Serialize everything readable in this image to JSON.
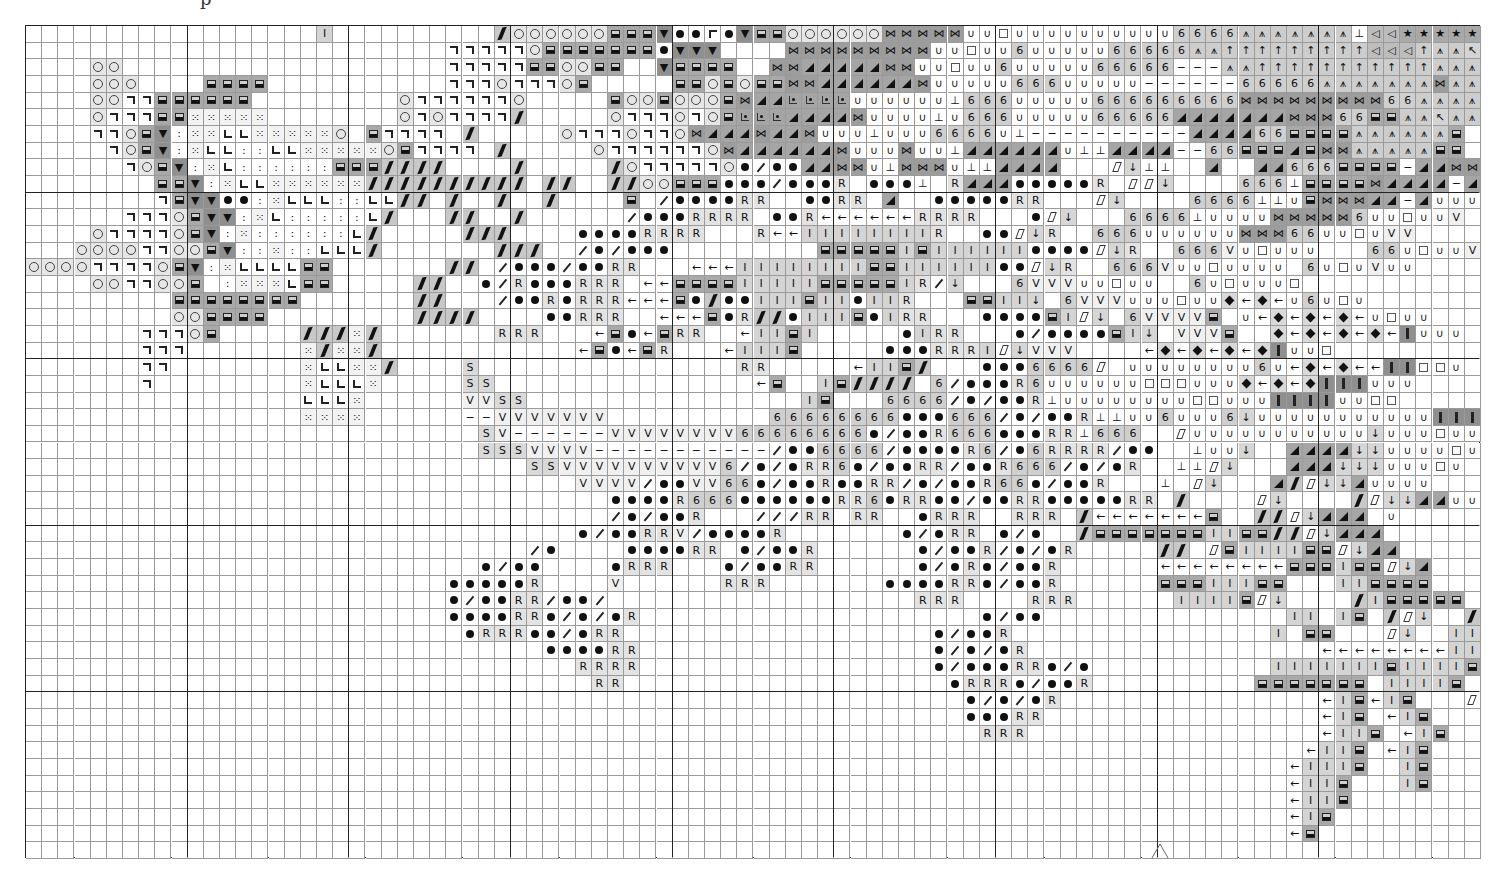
{
  "page": {
    "header_fragment": "p",
    "continuation_marker": "^"
  },
  "chart_data": {
    "type": "table",
    "columns": 90,
    "rows": 50,
    "major_grid_every": 10,
    "grid": {
      "left": 25,
      "top": 25,
      "width": 1455,
      "height": 833
    },
    "legend": {
      ".": {
        "glyph": "",
        "shade": "#ffffff",
        "name": "blank"
      },
      "o": {
        "glyph": "circle",
        "shade": "#e6e6e6",
        "name": "open-circle"
      },
      "n": {
        "glyph": "corner-right",
        "shade": "#ffffff",
        "name": "corner-top-right"
      },
      "B": {
        "glyph": "half-square",
        "shade": "#a9a9a9",
        "name": "half-filled-square"
      },
      "v": {
        "glyph": "▼",
        "shade": "#8f8f8f",
        "name": "down-triangle"
      },
      ":": {
        "glyph": "꞉",
        "shade": "#ffffff",
        "name": "colon"
      },
      "x": {
        "glyph": "⁙",
        "shade": "#f2f2f2",
        "name": "scatter-dots"
      },
      "L": {
        "glyph": "corner-left",
        "shade": "#ffffff",
        "name": "corner-bottom-left"
      },
      "\\": {
        "glyph": "thick-slash",
        "shade": "#c8c8c8",
        "name": "thick-backslash"
      },
      "/": {
        "glyph": "thin-slash",
        "shade": "#ffffff",
        "name": "thin-slash"
      },
      "*": {
        "glyph": "dot",
        "shade": "#ffffff",
        "name": "filled-dot"
      },
      "R": {
        "glyph": "R",
        "shade": "#e3e3e3",
        "name": "letter-r"
      },
      "<": {
        "glyph": "←",
        "shade": "#ffffff",
        "name": "left-arrow"
      },
      "I": {
        "glyph": "I",
        "shade": "#d4d4d4",
        "name": "letter-i"
      },
      "S": {
        "glyph": "S",
        "shade": "#d9d9d9",
        "name": "letter-s"
      },
      "V": {
        "glyph": "V",
        "shade": "#f0f0f0",
        "name": "letter-v"
      },
      "-": {
        "glyph": "−",
        "shade": "#ffffff",
        "name": "dash"
      },
      "6": {
        "glyph": "6",
        "shade": "#cfcfcf",
        "name": "digit-six"
      },
      "H": {
        "glyph": "⋈",
        "shade": "#9d9d9d",
        "name": "bowtie"
      },
      "A": {
        "glyph": "triangle",
        "shade": "#a5a5a5",
        "name": "corner-triangle"
      },
      "U": {
        "glyph": "∪",
        "shade": "#ffffff",
        "name": "cup"
      },
      "Q": {
        "glyph": "square",
        "shade": "#ffffff",
        "name": "open-square"
      },
      "T": {
        "glyph": "⊥",
        "shade": "#ffffff",
        "name": "up-tack"
      },
      "^": {
        "glyph": "⩚",
        "shade": "#cdcdcd",
        "name": "asterisk-arrow"
      },
      "|": {
        "glyph": "↑",
        "shade": "#cdcdcd",
        "name": "up-arrow"
      },
      "F": {
        "glyph": "corner-left-top",
        "shade": "#ffffff",
        "name": "corner-top-left"
      },
      "K": {
        "glyph": "↖",
        "shade": "#d4d4d4",
        "name": "nw-arrow"
      },
      "(": {
        "glyph": "◁",
        "shade": "#bdbdbd",
        "name": "left-triangle"
      },
      "k": {
        "glyph": "★",
        "shade": "#a9a9a9",
        "name": "star"
      },
      "e": {
        "glyph": "dotted-corner",
        "shade": "#a5a5a5",
        "name": "dotted-corner"
      },
      "z": {
        "glyph": "parallelogram",
        "shade": "#ffffff",
        "name": "parallelogram"
      },
      "d": {
        "glyph": "↓",
        "shade": "#d6d6d6",
        "name": "down-arrow"
      },
      "D": {
        "glyph": "diamond",
        "shade": "#d9d9d9",
        "name": "filled-diamond"
      },
      "!": {
        "glyph": "bar",
        "shade": "#8f8f8f",
        "name": "vertical-bar"
      },
      "p": {
        "glyph": "corner-left-top",
        "shade": "#ffffff",
        "name": "corner-box"
      }
    },
    "cells": [
      "..................I..........\\ooooooBBBv**p*vBBooooooHHHHHUUQUUUUUUUUUU6666^^^^^^^T((kkkkk|^^FTUUUU",
      "..........................nnnnnoBBBBBBB*vvv....HHHHHHHHHUUQUU6UUUUU66666^^|||||||||(((|^^KTTTUUU",
      "....oo....................nnnnnBBooBB..vBBBB..HHAAAAAHHUUQUU6UUUUU66666---^^|||||||||||^^^TFFFFK",
      "....ooo....BBBB...........nnnonnnoB.....BBoBoBBHHAAAAAAHUUUUU666UUUUU------66666^^^^^^^H^^K^KFFK^",
      "....oonnBBBBBB.........onnnnnno.....BooBoooBHAAeeeeUUUUUUT666UUUUU666666666HHHHHHHHH66^^^^^^^K^^",
      "....onnnBBxxxxx........ononnnn\\.....onnnonoBeeeAAAAHUUUUTU666UUUUU66666AAAAAAAHHH66BB^^K^^K^^^",
      "....nnoBv:xxLLxxxxxo.Bnnnn.\\.....onnnonnoHAAAHAAHUUUTUUU6666UT----------AAAA66BBBB^^^^^^B",
      ".....noBv:xLL::LLxxxxxoBnnnn.\\.....onnnnnnoHAAAAAAHUUUHUUTAAAAAAUTTAAAA--66BBBABHH^^^^^BB",
      "......noBv:xL::::::BBB\\\\\\\\....\\.....\\onnnnno*/**AAHHUTHHHUTTAAAA...zdTT..A..AA666BBBB-AAHH^^BBU",
      "........BBv:xLLxxxxxx\\\\\\\\\\\\\\\\\\\\.\\\\..\\\\ooBBB***/***R.***T.RAAA*****R.zzd....666TBBBBHAAAA-AUUUU",
      "........nBvv**:xLLL::LL\\\\.\\..\\..\\....B./****RR..**RR.A..*****RR...zd....6666TTUBHHHAA-AUUUUV",
      "......nnnoBvv:xL:::::L\\...\\\\..\\....../***RRRR.**R<<<<<<RRRR...*zd...6666TUUUUHHHHH6UUQUUV",
      "....onnnnoBv:x::::::L\\.....\\\\\\....****RRRR...R<<IIIIIIIIR..**zdR..666UUUUUUHHH66UUQUVV",
      "...oooonnooBv::x::LLL\\.......\\\\\\../*/***.........BBBBBIBIIIIII****zdR..666VUQUUU...66UQUUVU",
      "oooonnnnoBv:xLLLLBB.......\\\\./***/**RR...<<<IIIIIIIIBBIIIIII**zdR..666VUUQUUUU.6UQUVUU",
      "....oonnooB.:xxxLBB.....\\\\..*/R***RRR.<<BBBBIIIIIBBBBBIR/d...6VVVUUQUU..6UQUUUQ",
      ".........BBBBBBBB.......\\\\.../**R*RRR<<<B*\\**IIIBII*IIR...BBIId.6VVVUUUQUUD<D<U6UQU",
      ".........ooBBBB.........\\\\\\\\....**RRR..<<<B*R\\\\*IIIB*IRR...****BIzd.6VVVVB.U<D<D<D<UQUU",
      ".......nnnoB.....\\\\\\x\\.......RRR...<B*<BRR..<IIBI.....*IRR...*/****BId.VVVB..D<D<D<D<!UUU",
      ".......nnn.......x\\xx\\............<B*<BR...<IIIB.....***RRRIzdVVV....<D<D<D<D!UUQ",
      ".......nn........xLLxx\\....S................RR.....<IIB\\...***6666z0UUUUUUUU6U<D<D<<!!QQU",
      ".......n.........xLLLx.....SS................<B..IB\\\\\\\\.6/***R6UUUUUUQQQUUUD<D<D!!!UUU",
      ".................LLLx......VVSS.................IB...6666/*/**RTUUUUUUUUQQUUU!!!!UUQQ",
      ".................xxxx......--VVVVVVV..........66666666***666/*/**RTTUU6UUU6dUUUUUUUUUUU!!!UUUU",
      "............................SV------VVVVVVVV66666666*/**R666***RRT666..zUUUUUUUUUUUdUUUQUUU",
      "............................SSSVVVV-----------/**6666/****R6/*6RRRR/**..TUUd..AAAAddUUUUQUU",
      "...............................SSVVVVVVVVVV6/*/*RR6*/**RR/**R666/*/*R..TTzd...AAAdddUUUQU",
      "..................................VVVV/**VV66*/**R**RR/*/**R66*/**R...T.zd...A\\zddAUUUU",
      "....................................****R666******RR6*RR**/**RR*****RR.\\....zd....\\zddAAUUU",
      "..................................../*/**R...///RR.RR..*RRR..RRR.\\<<<<<<<B..\\\\zdAAA.U",
      "..................................*/**RRV/****R.......*/*RR.*/*..\\BBBBBBBIIBB\\\\zdAAA..",
      ".............................../*....****RR.*/**R......*/**R/*/*R.....\\\\.zBIIIIBBzdAA",
      "............................*/**....*RRR...*/**RR......*/*R*/**R......<<<<<<<<BBBIBBzdA",
      "..........................*****R....V......RRR.......****RR*/**R......BBBIIIBB...IIBBBB",
      "..........................*/**RR/**/...................RRR....RRR......IIIIBzd....\\IBBBBB",
      "..........................****RR*/*/*R.....................*/**...............II.IB.\\zd..\\IIIIIIB",
      "...........................*RRR**/*RR...................*/**R................I.BB...zd..IIIIBd..IIB",
      "................................****RR..................*/*/*R..................<<<<<<<<IIIIBzd...IB",
      "..................................RRRR..................*/***RR*/*...........IIIIIIIBIIIIB.zd....I",
      "...................................RR....................*RRR*/**R..........BBBBBBB.IIIIB..zd...I",
      "..........................................................*/*/*R................<IB<IB...zd..II",
      "..........................................................***RR.................<IB.<IB...zdIIB",
      "...........................................................RRR..................<IIB.<IB...zd.BB",
      "...............................................................................<IIB.<IB...zdB..",
      "..............................................................................<IIIB..IB...zd...I",
      "..............................................................................<IIB...IB....d...I",
      "..............................................................................<IIB.........d..IB",
      "..............................................................................<IB..........d..IB",
      "..............................................................................<B................",
      "...................................................................................................."
    ]
  }
}
